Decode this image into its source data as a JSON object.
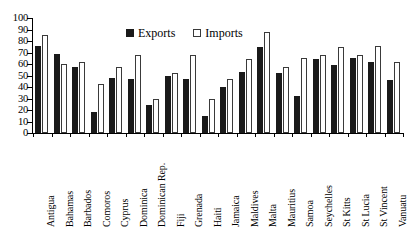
{
  "chart_data": {
    "type": "bar",
    "title": "",
    "xlabel": "",
    "ylabel": "",
    "ylim": [
      0,
      100
    ],
    "y_ticks": [
      0,
      10,
      20,
      30,
      40,
      50,
      60,
      70,
      80,
      90,
      100
    ],
    "grid": false,
    "legend_position": "top-center",
    "categories": [
      "Antigua",
      "Bahamas",
      "Barbados",
      "Comoros",
      "Cyprus",
      "Dominica",
      "Dominican Rep.",
      "Fiji",
      "Grenada",
      "Haiti",
      "Jamaica",
      "Maldives",
      "Malta",
      "Mauritius",
      "Samoa",
      "Seychelles",
      "St Kitts",
      "St Lucia",
      "St Vincent",
      "Vanuatu"
    ],
    "series": [
      {
        "name": "Exports",
        "color": "#1a1a1a",
        "style": "filled",
        "values": [
          76,
          69,
          57,
          18,
          48,
          47,
          24,
          50,
          47,
          15,
          40,
          53,
          75,
          52,
          32,
          64,
          59,
          65,
          62,
          46
        ]
      },
      {
        "name": "Imports",
        "color": "#ffffff",
        "style": "hollow",
        "values": [
          85,
          60,
          62,
          43,
          57,
          68,
          30,
          52,
          68,
          30,
          47,
          64,
          88,
          57,
          65,
          68,
          75,
          68,
          76,
          62
        ]
      }
    ]
  },
  "legend": {
    "items": [
      {
        "label": "Exports",
        "swatch": "filled-square-icon"
      },
      {
        "label": "Imports",
        "swatch": "hollow-square-icon"
      }
    ]
  }
}
